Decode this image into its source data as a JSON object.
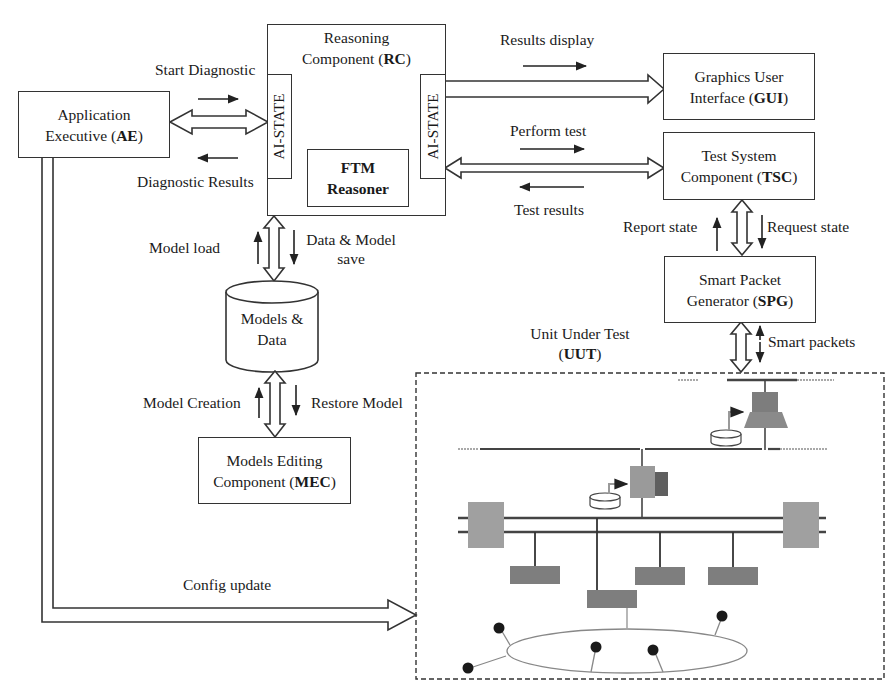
{
  "diagram": {
    "components": {
      "ae": {
        "line1": "Application",
        "line2_pre": "Executive (",
        "abbr": "AE",
        "line2_post": ")"
      },
      "rc": {
        "line1": "Reasoning",
        "line2_pre": "Component (",
        "abbr": "RC",
        "line2_post": ")"
      },
      "rc_left_state": "AI-STATE",
      "rc_right_state": "AI-STATE",
      "ftm": {
        "line1": "FTM",
        "line2": "Reasoner"
      },
      "gui": {
        "line1": "Graphics User",
        "line2_pre": "Interface (",
        "abbr": "GUI",
        "line2_post": ")"
      },
      "tsc": {
        "line1": "Test System",
        "line2_pre": "Component (",
        "abbr": "TSC",
        "line2_post": ")"
      },
      "spg": {
        "line1": "Smart Packet",
        "line2_pre": "Generator (",
        "abbr": "SPG",
        "line2_post": ")"
      },
      "db": {
        "line1": "Models &",
        "line2": "Data"
      },
      "mec": {
        "line1": "Models Editing",
        "line2_pre": "Component (",
        "abbr": "MEC",
        "line2_post": ")"
      },
      "uut": {
        "line1": "Unit Under Test",
        "line2_pre": "(",
        "abbr": "UUT",
        "line2_post": ")"
      }
    },
    "flows": {
      "start_diagnostic": "Start Diagnostic",
      "diagnostic_results": "Diagnostic Results",
      "results_display": "Results display",
      "perform_test": "Perform test",
      "test_results": "Test results",
      "model_load": "Model load",
      "data_model_save_1": "Data & Model",
      "data_model_save_2": "save",
      "model_creation": "Model Creation",
      "restore_model": "Restore Model",
      "report_state": "Report state",
      "request_state": "Request state",
      "smart_packets": "Smart packets",
      "config_update": "Config update"
    },
    "colors": {
      "line": "#333333",
      "device": "#9a9a9a",
      "device_dark": "#6f6f6f",
      "network": "#7a7a7a",
      "node": "#1a1a1a"
    }
  }
}
